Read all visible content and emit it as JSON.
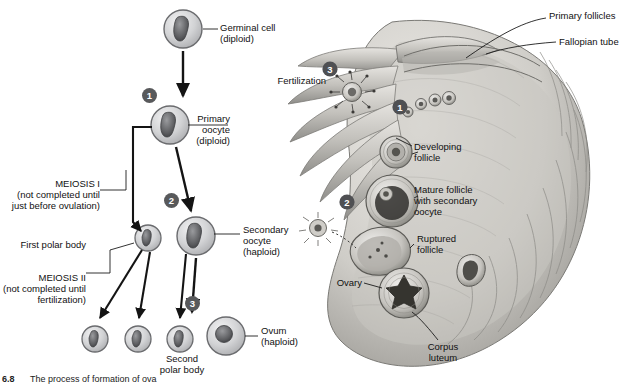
{
  "figure": {
    "number": "6.8",
    "caption": "The process of formation of ova"
  },
  "left_panel": {
    "title": "oogenesis-flow-diagram",
    "labels": [
      {
        "id": "germinal-cell",
        "text": "Germinal cell\n(diploid)"
      },
      {
        "id": "primary-oocyte",
        "text": "Primary\noocyte\n(diploid)"
      },
      {
        "id": "meiosis-i",
        "text": "MEIOSIS I\n(not completed until\njust before ovulation)"
      },
      {
        "id": "first-polar-body",
        "text": "First polar body"
      },
      {
        "id": "meiosis-ii",
        "text": "MEIOSIS II\n(not completed until\nfertilization)"
      },
      {
        "id": "secondary-oocyte",
        "text": "Secondary\noocyte\n(haploid)"
      },
      {
        "id": "second-polar-body",
        "text": "Second\npolar body"
      },
      {
        "id": "ovum",
        "text": "Ovum\n(haploid)"
      }
    ],
    "stage_badges": [
      "1",
      "2",
      "3"
    ]
  },
  "right_panel": {
    "title": "ovary-cross-section",
    "labels": [
      {
        "id": "primary-follicles",
        "text": "Primary follicles"
      },
      {
        "id": "fallopian-tube",
        "text": "Fallopian tube"
      },
      {
        "id": "fertilization",
        "text": "Fertilization"
      },
      {
        "id": "developing-follicle",
        "text": "Developing\nfollicle"
      },
      {
        "id": "mature-follicle",
        "text": "Mature follicle\nwith secondary\noocyte"
      },
      {
        "id": "ruptured-follicle",
        "text": "Ruptured\nfollicle"
      },
      {
        "id": "ovary",
        "text": "Ovary"
      },
      {
        "id": "corpus-luteum",
        "text": "Corpus\nluteum"
      }
    ],
    "stage_badges": [
      "1",
      "2",
      "3"
    ]
  },
  "colors": {
    "badge": "#58595b",
    "cell_outline": "#6a6b6e",
    "cell_fill": "#cfd0d2",
    "nucleus": "#4a4b4e",
    "tissue_light": "#d7d6d2",
    "tissue_mid": "#a9a8a4",
    "tissue_dark": "#6e6d6a",
    "arrow": "#1a1a1a"
  }
}
